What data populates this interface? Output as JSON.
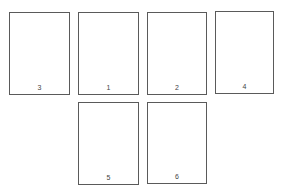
{
  "diagram": {
    "row1": [
      {
        "label": "3"
      },
      {
        "label": "1"
      },
      {
        "label": "2"
      },
      {
        "label": "4"
      }
    ],
    "row2": [
      {
        "label": "5"
      },
      {
        "label": "6"
      }
    ]
  }
}
